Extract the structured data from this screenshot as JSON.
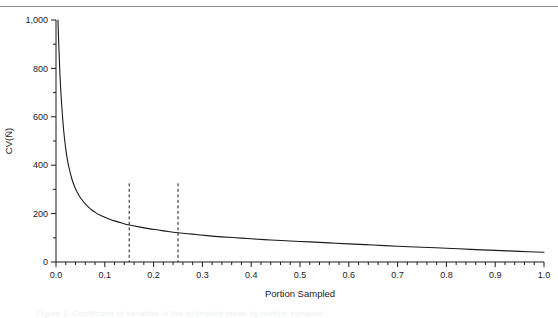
{
  "figure": {
    "background_color": "#ffffff",
    "rule_color": "#8c8c8c",
    "caption_text": "Figure 1. Coefficient of variation of the estimated mean by portion sampled."
  },
  "chart_data": {
    "type": "line",
    "title": "",
    "xlabel": "Portion Sampled",
    "ylabel": "CV(N̄)",
    "xlim": [
      0.0,
      1.0
    ],
    "ylim": [
      0,
      1000
    ],
    "grid": false,
    "legend": null,
    "x_ticks": [
      0.0,
      0.1,
      0.2,
      0.3,
      0.4,
      0.5,
      0.6,
      0.7,
      0.8,
      0.9,
      1.0
    ],
    "x_tick_labels": [
      "0.0",
      "0.1",
      "0.2",
      "0.3",
      "0.4",
      "0.5",
      "0.6",
      "0.7",
      "0.8",
      "0.9",
      "1.0"
    ],
    "x_minor_step": 0.02,
    "y_ticks": [
      0,
      200,
      400,
      600,
      800,
      1000
    ],
    "y_tick_labels": [
      "0",
      "200",
      "400",
      "600",
      "800",
      "1,000"
    ],
    "y_minor_step": 100,
    "line_color": "#1a1a1a",
    "line_width": 1.1,
    "series": [
      {
        "name": "CV of mean",
        "x": [
          0.004,
          0.006,
          0.008,
          0.01,
          0.012,
          0.015,
          0.018,
          0.021,
          0.025,
          0.029,
          0.033,
          0.038,
          0.043,
          0.048,
          0.054,
          0.06,
          0.067,
          0.074,
          0.082,
          0.09,
          0.1,
          0.11,
          0.12,
          0.135,
          0.15,
          0.17,
          0.19,
          0.21,
          0.23,
          0.25,
          0.28,
          0.31,
          0.34,
          0.37,
          0.4,
          0.44,
          0.48,
          0.52,
          0.56,
          0.6,
          0.65,
          0.7,
          0.75,
          0.8,
          0.85,
          0.9,
          0.95,
          1.0
        ],
        "y": [
          1000,
          880,
          780,
          700,
          640,
          560,
          500,
          452,
          405,
          370,
          340,
          312,
          290,
          272,
          255,
          240,
          226,
          214,
          203,
          194,
          185,
          177,
          170,
          161,
          153,
          145,
          138,
          132,
          126,
          121,
          115,
          109,
          104,
          100,
          96,
          91,
          87,
          83,
          79,
          75,
          70,
          65,
          61,
          57,
          52,
          48,
          44,
          40
        ]
      }
    ],
    "annotations": [
      {
        "type": "vline",
        "name": "reference-line-left",
        "x": 0.15,
        "y_from": 0,
        "y_to": 325,
        "style": "dashed",
        "color": "#1a1a1a"
      },
      {
        "type": "vline",
        "name": "reference-line-right",
        "x": 0.25,
        "y_from": 0,
        "y_to": 325,
        "style": "dashed",
        "color": "#1a1a1a"
      }
    ]
  }
}
